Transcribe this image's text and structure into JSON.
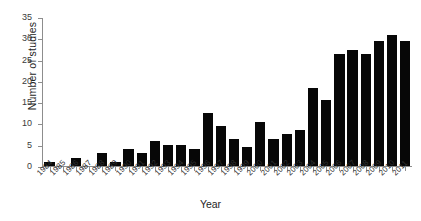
{
  "chart_data": {
    "type": "bar",
    "title": "",
    "xlabel": "Year",
    "ylabel": "Number of studies",
    "ylim": [
      0,
      35
    ],
    "yticks": [
      0,
      5,
      10,
      15,
      20,
      25,
      30,
      35
    ],
    "grid": false,
    "legend": null,
    "bar_color": "#070707",
    "axis_color": "#8d8d8d",
    "categories": [
      "1984",
      "1985",
      "1986",
      "1987",
      "1988",
      "1989",
      "1990",
      "1991",
      "1992",
      "1993",
      "1994",
      "1995",
      "1996",
      "1997",
      "1998",
      "1999",
      "2000",
      "2001",
      "2002",
      "2003",
      "2004",
      "2005",
      "2006",
      "2007",
      "2008",
      "2009",
      "2010",
      "2011"
    ],
    "values": [
      1,
      0,
      2,
      0,
      3,
      1,
      4,
      3,
      6,
      5,
      5,
      4,
      12.5,
      9.5,
      6.5,
      4.5,
      10.5,
      6.5,
      7.5,
      8.5,
      18.5,
      15.5,
      26.5,
      27.5,
      26.5,
      29.5,
      31,
      29.5
    ]
  },
  "figure": {
    "caption": ""
  }
}
